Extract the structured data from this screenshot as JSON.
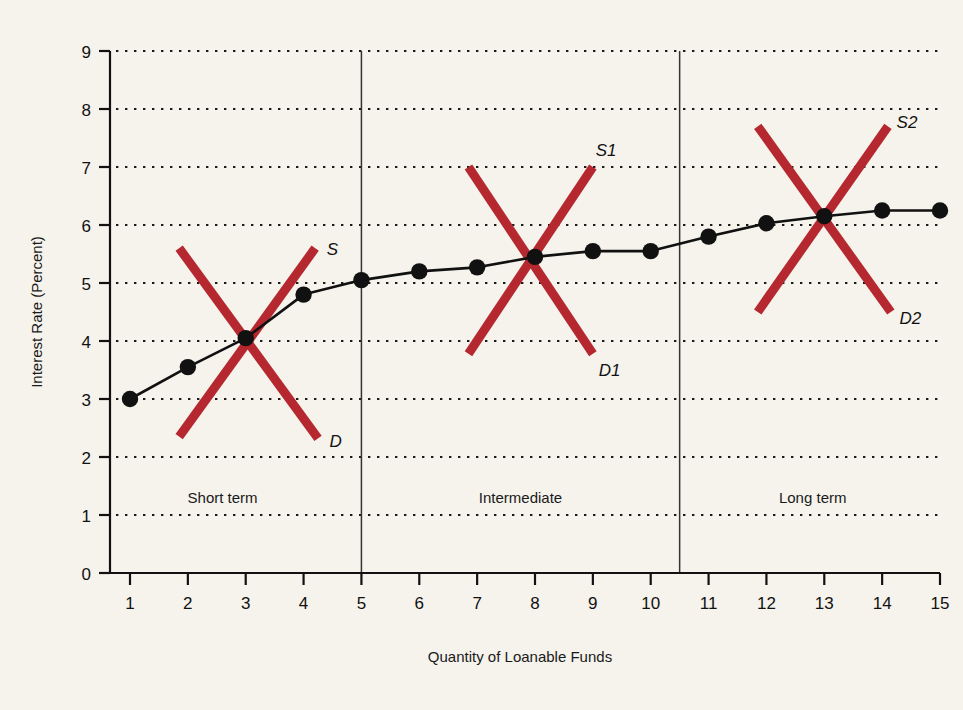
{
  "chart_data": {
    "type": "line",
    "title": "",
    "xlabel": "Quantity of Loanable Funds",
    "ylabel": "Interest Rate (Percent)",
    "xlim": [
      0,
      15
    ],
    "ylim": [
      0,
      9
    ],
    "grid": "dotted-horizontal",
    "legend_position": "none",
    "x_ticks": [
      "1",
      "2",
      "3",
      "4",
      "5",
      "6",
      "7",
      "8",
      "9",
      "10",
      "11",
      "12",
      "13",
      "14",
      "15"
    ],
    "y_ticks": [
      "0",
      "1",
      "2",
      "3",
      "4",
      "5",
      "6",
      "7",
      "8",
      "9"
    ],
    "series": [
      {
        "name": "Yield Curve",
        "marker": "filled-circle",
        "color": "#111111",
        "x": [
          1,
          2,
          3,
          4,
          5,
          6,
          7,
          8,
          9,
          10,
          11,
          12,
          13,
          14,
          15
        ],
        "values": [
          3.0,
          3.55,
          4.05,
          4.8,
          5.05,
          5.2,
          5.27,
          5.45,
          5.55,
          5.55,
          5.8,
          6.03,
          6.15,
          6.25,
          6.25
        ]
      }
    ],
    "annotations": {
      "region_dividers": [
        5,
        10.5
      ],
      "regions": [
        {
          "label": "Short term",
          "center_x": 2.6,
          "label_y": 1.2
        },
        {
          "label": "Intermediate",
          "center_x": 7.75,
          "label_y": 1.2
        },
        {
          "label": "Long term",
          "center_x": 12.8,
          "label_y": 1.2
        }
      ],
      "supply_demand_crosses": [
        {
          "supply_label": "S",
          "demand_label": "D",
          "color": "#b5282f",
          "equilibrium": {
            "x": 3.0,
            "y": 4.05
          },
          "supply_line": {
            "x1": 1.85,
            "y1": 2.35,
            "x2": 4.2,
            "y2": 5.6
          },
          "demand_line": {
            "x1": 1.85,
            "y1": 5.6,
            "x2": 4.25,
            "y2": 2.32
          },
          "supply_label_pos": {
            "x": 4.4,
            "y": 5.58
          },
          "demand_label_pos": {
            "x": 4.45,
            "y": 2.28
          }
        },
        {
          "supply_label": "S1",
          "demand_label": "D1",
          "color": "#b5282f",
          "equilibrium": {
            "x": 8.0,
            "y": 5.45
          },
          "supply_line": {
            "x1": 6.85,
            "y1": 3.78,
            "x2": 9.0,
            "y2": 7.0
          },
          "demand_line": {
            "x1": 6.85,
            "y1": 7.0,
            "x2": 9.0,
            "y2": 3.78
          },
          "supply_label_pos": {
            "x": 9.05,
            "y": 7.3
          },
          "demand_label_pos": {
            "x": 9.1,
            "y": 3.5
          }
        },
        {
          "supply_label": "S2",
          "demand_label": "D2",
          "color": "#b5282f",
          "equilibrium": {
            "x": 13.0,
            "y": 6.15
          },
          "supply_line": {
            "x1": 11.85,
            "y1": 4.5,
            "x2": 14.1,
            "y2": 7.7
          },
          "demand_line": {
            "x1": 11.85,
            "y1": 7.7,
            "x2": 14.15,
            "y2": 4.5
          },
          "supply_label_pos": {
            "x": 14.25,
            "y": 7.78
          },
          "demand_label_pos": {
            "x": 14.3,
            "y": 4.4
          }
        }
      ]
    }
  },
  "colors": {
    "background": "#f5f3ec",
    "axis": "#111111",
    "curve": "#111111",
    "supply_demand": "#b5282f",
    "grid_dot": "#1a1a1a"
  }
}
